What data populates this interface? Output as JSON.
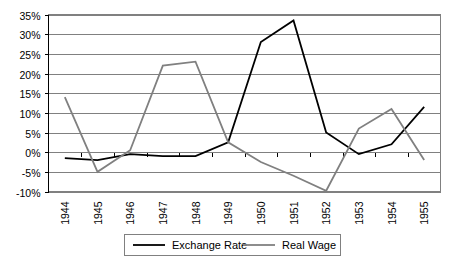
{
  "chart_data": {
    "type": "line",
    "title": "",
    "xlabel": "",
    "ylabel": "",
    "categories": [
      "1944",
      "1945",
      "1946",
      "1947",
      "1948",
      "1949",
      "1950",
      "1951",
      "1952",
      "1953",
      "1954",
      "1955"
    ],
    "series": [
      {
        "name": "Exchange Rate",
        "color": "#000000",
        "values": [
          -1.5,
          -2.0,
          -0.5,
          -1.0,
          -1.0,
          2.5,
          28.0,
          33.5,
          5.0,
          -0.5,
          2.0,
          11.5
        ]
      },
      {
        "name": "Real Wage",
        "color": "#808080",
        "values": [
          14.0,
          -5.0,
          0.5,
          22.0,
          23.0,
          2.5,
          -2.5,
          -6.0,
          -9.8,
          6.0,
          11.0,
          -2.0
        ]
      }
    ],
    "ylim": [
      -10,
      35
    ],
    "ytick_labels": [
      "35%",
      "30%",
      "25%",
      "20%",
      "15%",
      "10%",
      "5%",
      "0%",
      "-5%",
      "-10%"
    ],
    "ytick_values": [
      35,
      30,
      25,
      20,
      15,
      10,
      5,
      0,
      -5,
      -10
    ],
    "grid": true,
    "legend_position": "bottom",
    "legend_entries": [
      "Exchange Rate",
      "Real Wage"
    ]
  }
}
